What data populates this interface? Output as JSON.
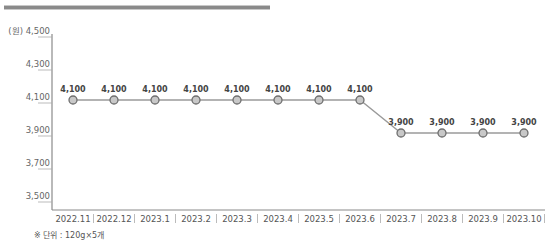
{
  "chart_data": {
    "type": "line",
    "title": "",
    "ylabel": "(원)",
    "xlabel": "",
    "ylim": [
      3500,
      4500
    ],
    "yticks": [
      3500,
      3700,
      3900,
      4100,
      4300,
      4500
    ],
    "ytick_labels": [
      "3,500",
      "3,700",
      "3,900",
      "4,100",
      "4,300",
      "(원) 4,500"
    ],
    "categories": [
      "2022.11",
      "2022.12",
      "2023.1",
      "2023.2",
      "2023.3",
      "2023.4",
      "2023.5",
      "2023.6",
      "2023.7",
      "2023.8",
      "2023.9",
      "2023.10"
    ],
    "values": [
      4100,
      4100,
      4100,
      4100,
      4100,
      4100,
      4100,
      4100,
      3900,
      3900,
      3900,
      3900
    ],
    "data_labels": [
      "4,100",
      "4,100",
      "4,100",
      "4,100",
      "4,100",
      "4,100",
      "4,100",
      "4,100",
      "3,900",
      "3,900",
      "3,900",
      "3,900"
    ],
    "grid": false,
    "legend": null
  },
  "footnote": "※ 단위 : 120g×5개",
  "colors": {
    "line": "#9a9a9a",
    "marker_fill": "#c8c8c8",
    "marker_stroke": "#6e6e6e",
    "axis": "#8a8a8a"
  }
}
